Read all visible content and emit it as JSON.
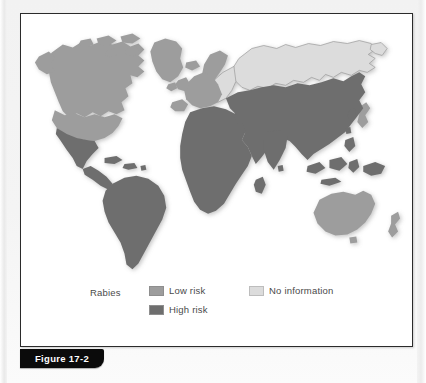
{
  "figure": {
    "number_label": "Figure 17-2",
    "subject": "Rabies"
  },
  "map": {
    "title": "World map of rabies risk",
    "projection": "world-silhouette",
    "colors": {
      "low_risk": "#9d9d9d",
      "high_risk": "#6e6e6e",
      "no_information": "#dcdcdc",
      "outline": "#8a8a8a",
      "background": "#ffffff"
    },
    "regions": [
      {
        "name": "canada",
        "category": "low_risk"
      },
      {
        "name": "united-states",
        "category": "low_risk"
      },
      {
        "name": "greenland",
        "category": "low_risk"
      },
      {
        "name": "arctic-islands",
        "category": "low_risk"
      },
      {
        "name": "mexico",
        "category": "high_risk"
      },
      {
        "name": "central-america",
        "category": "high_risk"
      },
      {
        "name": "caribbean",
        "category": "high_risk"
      },
      {
        "name": "south-america",
        "category": "high_risk"
      },
      {
        "name": "western-europe",
        "category": "low_risk"
      },
      {
        "name": "scandinavia",
        "category": "low_risk"
      },
      {
        "name": "british-isles",
        "category": "low_risk"
      },
      {
        "name": "eastern-europe",
        "category": "no_information"
      },
      {
        "name": "russia",
        "category": "no_information"
      },
      {
        "name": "north-africa",
        "category": "high_risk"
      },
      {
        "name": "sub-saharan-africa",
        "category": "high_risk"
      },
      {
        "name": "madagascar",
        "category": "high_risk"
      },
      {
        "name": "middle-east",
        "category": "high_risk"
      },
      {
        "name": "india",
        "category": "high_risk"
      },
      {
        "name": "china",
        "category": "high_risk"
      },
      {
        "name": "southeast-asia",
        "category": "high_risk"
      },
      {
        "name": "indonesia",
        "category": "high_risk"
      },
      {
        "name": "japan",
        "category": "low_risk"
      },
      {
        "name": "korean-peninsula",
        "category": "high_risk"
      },
      {
        "name": "philippines",
        "category": "high_risk"
      },
      {
        "name": "papua-new-guinea",
        "category": "high_risk"
      },
      {
        "name": "australia",
        "category": "low_risk"
      },
      {
        "name": "new-zealand",
        "category": "low_risk"
      }
    ]
  },
  "legend": {
    "title": "Rabies",
    "entries": [
      {
        "key": "low_risk",
        "label": "Low risk",
        "color": "#9d9d9d"
      },
      {
        "key": "high_risk",
        "label": "High risk",
        "color": "#6e6e6e"
      },
      {
        "key": "no_information",
        "label": "No information",
        "color": "#dcdcdc"
      }
    ]
  }
}
